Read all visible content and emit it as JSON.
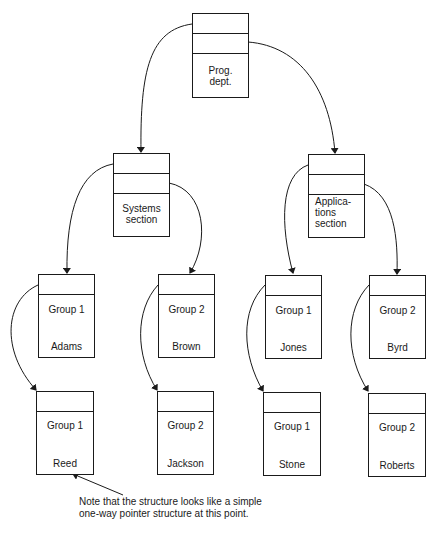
{
  "colors": {
    "ink": "#1a1a1a",
    "background": "#ffffff"
  },
  "nodes": {
    "prog_dept": {
      "label": "Prog.\ndept.",
      "lines": [
        "Prog.",
        "dept."
      ]
    },
    "systems": {
      "lines": [
        "Systems",
        "section"
      ]
    },
    "applications": {
      "lines": [
        "Applica-",
        "tions",
        "section"
      ]
    },
    "adams": {
      "group": "Group 1",
      "name": "Adams"
    },
    "brown": {
      "group": "Group 2",
      "name": "Brown"
    },
    "jones": {
      "group": "Group 1",
      "name": "Jones"
    },
    "byrd": {
      "group": "Group 2",
      "name": "Byrd"
    },
    "reed": {
      "group": "Group 1",
      "name": "Reed"
    },
    "jackson": {
      "group": "Group 2",
      "name": "Jackson"
    },
    "stone": {
      "group": "Group 1",
      "name": "Stone"
    },
    "roberts": {
      "group": "Group 2",
      "name": "Roberts"
    }
  },
  "note": {
    "line1": "Note that the structure looks like a simple",
    "line2": "one-way pointer structure at this point."
  }
}
